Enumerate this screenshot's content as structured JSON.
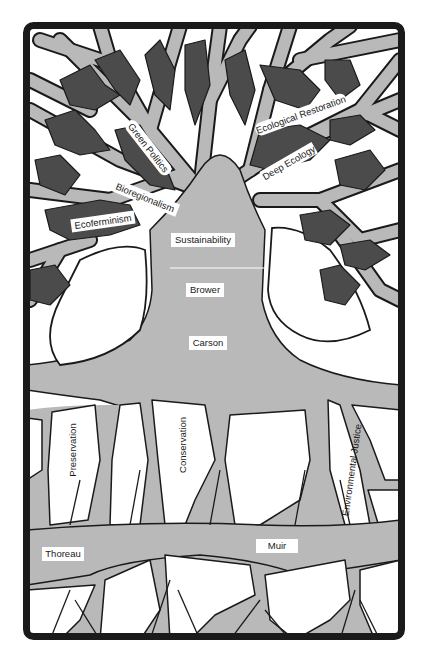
{
  "diagram": {
    "type": "tree-illustration",
    "colors": {
      "frame": "#1a1a1a",
      "branch_fill": "#b9b9b9",
      "arrow_fill": "#4b4b4b",
      "background": "#ffffff",
      "outline": "#1a1a1a"
    },
    "canopy_labels": {
      "green_politics": "Green Politics",
      "bioregionalism": "Bioregionalism",
      "ecoferminism": "Ecoferminism",
      "ecological_restoration": "Ecological Restoration",
      "deep_ecology": "Deep Ecology",
      "sustainability": "Sustainability"
    },
    "trunk_labels": {
      "brower": "Brower",
      "carson": "Carson"
    },
    "root_labels": {
      "preservation": "Preservation",
      "conservation": "Conservation",
      "environmental_justice": "Environmental Justice",
      "thoreau": "Thoreau",
      "muir": "Muir"
    }
  }
}
